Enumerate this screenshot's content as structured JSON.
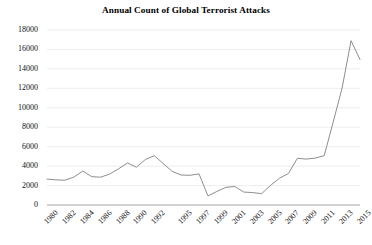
{
  "chart_data": {
    "type": "line",
    "title": "Annual Count of Global Terrorist Attacks",
    "xlabel": "",
    "ylabel": "",
    "grid": true,
    "legend": false,
    "x": [
      1980,
      1981,
      1982,
      1983,
      1984,
      1985,
      1986,
      1987,
      1988,
      1989,
      1990,
      1991,
      1992,
      1994,
      1995,
      1996,
      1997,
      1998,
      1999,
      2000,
      2001,
      2002,
      2003,
      2004,
      2005,
      2006,
      2007,
      2008,
      2009,
      2010,
      2011,
      2012,
      2013,
      2014,
      2015
    ],
    "values": [
      2661,
      2586,
      2545,
      2870,
      3494,
      2915,
      2860,
      3183,
      3721,
      4324,
      3887,
      4683,
      5071,
      3456,
      3081,
      3058,
      3197,
      934,
      1395,
      1814,
      1907,
      1333,
      1277,
      1166,
      2017,
      2758,
      3242,
      4805,
      4721,
      4826,
      5076,
      8522,
      12036,
      16903,
      14965
    ],
    "xlim": [
      1980,
      2015
    ],
    "ylim": [
      0,
      18000
    ],
    "ytick_values": [
      0,
      2000,
      4000,
      6000,
      8000,
      10000,
      12000,
      14000,
      16000,
      18000
    ],
    "ytick_labels": [
      "0",
      "2000",
      "4000",
      "6000",
      "8000",
      "10000",
      "12000",
      "14000",
      "16000",
      "18000"
    ],
    "xtick_values": [
      1980,
      1982,
      1984,
      1986,
      1988,
      1990,
      1992,
      1995,
      1997,
      1999,
      2001,
      2003,
      2005,
      2007,
      2009,
      2011,
      2013,
      2015
    ],
    "xtick_labels": [
      "1980",
      "1982",
      "1984",
      "1986",
      "1988",
      "1990",
      "1992",
      "1995",
      "1997",
      "1999",
      "2001",
      "2003",
      "2005",
      "2007",
      "2009",
      "2011",
      "2013",
      "2015"
    ],
    "series_color": "#808080",
    "gridline_color": "#e8e8e8",
    "axis_color": "#a6a6a6"
  }
}
